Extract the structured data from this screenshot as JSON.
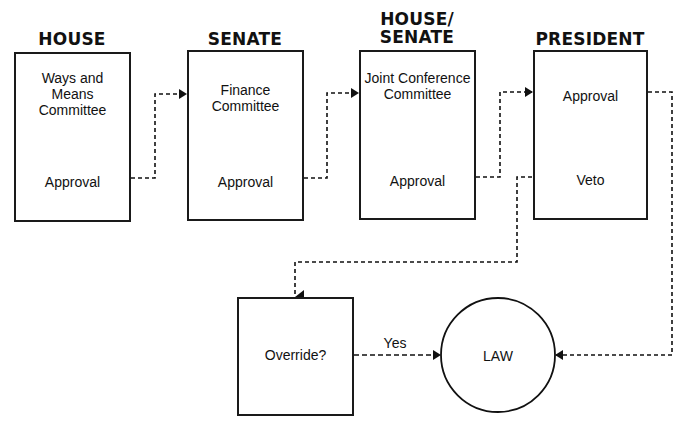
{
  "stages": [
    {
      "heading": "HOUSE",
      "top": "Ways and Means Committee",
      "bottom": "Approval"
    },
    {
      "heading": "SENATE",
      "top": "Finance Committee",
      "bottom": "Approval"
    },
    {
      "heading": "HOUSE/ SENATE",
      "top": "Joint Conference Committee",
      "bottom": "Approval"
    },
    {
      "heading": "PRESIDENT",
      "top": "Approval",
      "bottom": "Veto"
    }
  ],
  "override": {
    "label": "Override?",
    "yes_label": "Yes"
  },
  "law": {
    "label": "LAW"
  }
}
